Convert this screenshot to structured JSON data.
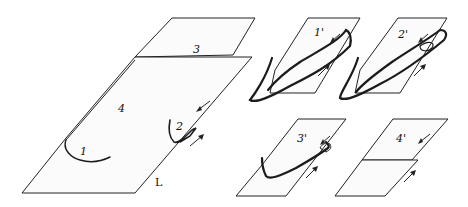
{
  "figure": {
    "main_panel": {
      "labels": {
        "loop_1": "1",
        "loop_2": "2",
        "line_3": "3",
        "region_4": "4",
        "line_L": "L"
      }
    },
    "small_panels": [
      {
        "id": "p1",
        "label": "1'"
      },
      {
        "id": "p2",
        "label": "2'"
      },
      {
        "id": "p3",
        "label": "3'"
      },
      {
        "id": "p4",
        "label": "4'"
      }
    ],
    "colors": {
      "ink": "#1a1a1a",
      "paper": "#ffffff"
    }
  }
}
